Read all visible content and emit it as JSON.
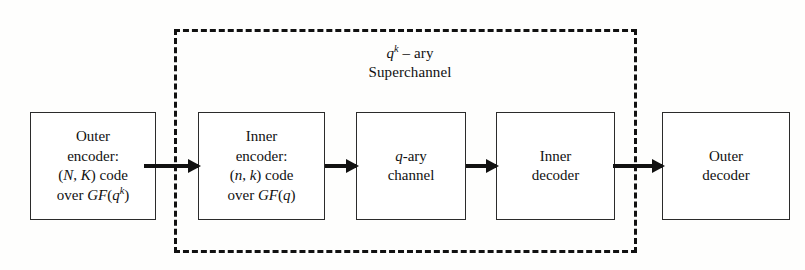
{
  "diagram": {
    "colors": {
      "background": "#fefefd",
      "stroke": "#111111",
      "box_border": "#2b2b2b",
      "box_fill": "#ffffff"
    },
    "superchannel": {
      "label_line1": "qᵏ – ary",
      "label_line2": "Superchannel",
      "label_line1_base": "q",
      "label_line1_exponent": "k",
      "label_line1_suffix": " – ary",
      "border_style": "dashed"
    },
    "blocks": [
      {
        "id": "outer-encoder",
        "name": "Outer encoder",
        "lines": [
          "Outer",
          "encoder:",
          "(N, K) code",
          "over GF(qᵏ)"
        ],
        "line1": "Outer",
        "line2": "encoder:",
        "line3_prefix": "(",
        "line3_var1": "N",
        "line3_mid": ", ",
        "line3_var2": "K",
        "line3_suffix": ") code",
        "line4_prefix": "over ",
        "line4_field": "GF",
        "line4_open": "(",
        "line4_var": "q",
        "line4_exp": "k",
        "line4_close": ")"
      },
      {
        "id": "inner-encoder",
        "name": "Inner encoder",
        "lines": [
          "Inner",
          "encoder:",
          "(n, k) code",
          "over GF(q)"
        ],
        "line1": "Inner",
        "line2": "encoder:",
        "line3_prefix": "(",
        "line3_var1": "n",
        "line3_mid": ", ",
        "line3_var2": "k",
        "line3_suffix": ") code",
        "line4_prefix": "over ",
        "line4_field": "GF",
        "line4_open": "(",
        "line4_var": "q",
        "line4_exp": "",
        "line4_close": ")"
      },
      {
        "id": "channel",
        "name": "q-ary channel",
        "lines": [
          "q-ary",
          "channel"
        ],
        "line1_var": "q",
        "line1_suffix": "-ary",
        "line2": "channel"
      },
      {
        "id": "inner-decoder",
        "name": "Inner decoder",
        "lines": [
          "Inner",
          "decoder"
        ],
        "line1": "Inner",
        "line2": "decoder"
      },
      {
        "id": "outer-decoder",
        "name": "Outer decoder",
        "lines": [
          "Outer",
          "decoder"
        ],
        "line1": "Outer",
        "line2": "decoder"
      }
    ],
    "arrows": [
      {
        "id": "arrow-1",
        "from": "outer-encoder",
        "to": "inner-encoder"
      },
      {
        "id": "arrow-2",
        "from": "inner-encoder",
        "to": "channel"
      },
      {
        "id": "arrow-3",
        "from": "channel",
        "to": "inner-decoder"
      },
      {
        "id": "arrow-4",
        "from": "inner-decoder",
        "to": "outer-decoder"
      }
    ]
  }
}
